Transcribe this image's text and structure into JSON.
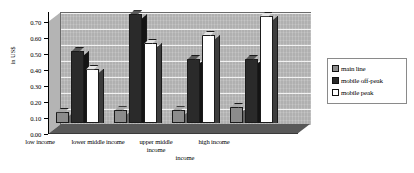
{
  "chart_data": {
    "type": "bar",
    "title": "",
    "xlabel": "income",
    "ylabel": "in US$",
    "ylim": [
      0.0,
      0.7
    ],
    "ytick_labels": [
      "0.70",
      "0.60",
      "0.50",
      "0.40",
      "0.30",
      "0.20",
      "0.10",
      "0.00"
    ],
    "ytick_values": [
      0.7,
      0.6,
      0.5,
      0.4,
      0.3,
      0.2,
      0.1,
      0.0
    ],
    "grid": true,
    "legend_position": "right",
    "categories": [
      "low income",
      "lower middle income",
      "upper middle income",
      "high income"
    ],
    "series": [
      {
        "name": "main line",
        "color": "#8c8c8c",
        "values": [
          0.07,
          0.08,
          0.08,
          0.1
        ]
      },
      {
        "name": "mobile off-peak",
        "color": "#2a2a2a",
        "values": [
          0.45,
          0.68,
          0.4,
          0.4
        ]
      },
      {
        "name": "mobile peak",
        "color": "#ffffff",
        "values": [
          0.34,
          0.5,
          0.55,
          0.67
        ]
      }
    ]
  },
  "axis": {
    "y_title": "in US$",
    "x_title": "income"
  },
  "legend": {
    "items": [
      {
        "label": "main line"
      },
      {
        "label": "mobile off-peak"
      },
      {
        "label": "mobile peak"
      }
    ]
  },
  "x_labels": [
    {
      "line1": "low income",
      "line2": ""
    },
    {
      "line1": "lower middle income",
      "line2": ""
    },
    {
      "line1": "upper middle",
      "line2": "income"
    },
    {
      "line1": "high income",
      "line2": ""
    }
  ]
}
